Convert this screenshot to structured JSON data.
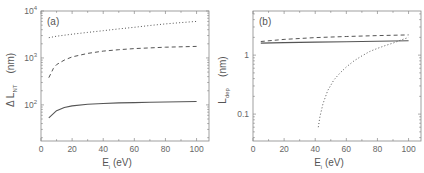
{
  "chart_data": [
    {
      "type": "line",
      "panel_label": "(a)",
      "title": "",
      "xlabel": "E",
      "xlabel_sub": "i",
      "xlabel_unit": "(eV)",
      "ylabel": "Δ L",
      "ylabel_sub": "NT",
      "ylabel_unit": "(nm)",
      "xscale": "linear",
      "yscale": "log",
      "xlim": [
        0,
        108
      ],
      "ylim": [
        17,
        10000
      ],
      "xticks": [
        0,
        20,
        40,
        60,
        80,
        100
      ],
      "yticks": [
        100,
        1000,
        10000
      ],
      "ytick_labels": [
        {
          "base": "10",
          "exp": "2"
        },
        {
          "base": "10",
          "exp": "3"
        },
        {
          "base": "10",
          "exp": "4"
        }
      ],
      "grid": false,
      "legend": null,
      "series": [
        {
          "name": "solid",
          "style": "solid",
          "x": [
            5,
            10,
            15,
            20,
            30,
            40,
            50,
            60,
            70,
            80,
            90,
            100
          ],
          "values": [
            53,
            75,
            88,
            95,
            103,
            107,
            110,
            112,
            114,
            115,
            117,
            118
          ]
        },
        {
          "name": "dashed",
          "style": "dashed",
          "x": [
            5,
            8,
            10,
            15,
            20,
            30,
            40,
            50,
            60,
            70,
            80,
            90,
            100
          ],
          "values": [
            380,
            600,
            720,
            900,
            1050,
            1250,
            1400,
            1500,
            1580,
            1640,
            1690,
            1730,
            1760
          ]
        },
        {
          "name": "dotted",
          "style": "dotted",
          "x": [
            5,
            10,
            20,
            30,
            40,
            50,
            60,
            70,
            80,
            90,
            100
          ],
          "values": [
            2700,
            2900,
            3200,
            3500,
            3800,
            4150,
            4500,
            4900,
            5300,
            5650,
            6000
          ]
        }
      ]
    },
    {
      "type": "line",
      "panel_label": "(b)",
      "title": "",
      "xlabel": "E",
      "xlabel_sub": "i",
      "xlabel_unit": "(eV)",
      "ylabel": "L",
      "ylabel_sub": "dep",
      "ylabel_unit": "(nm)",
      "xscale": "linear",
      "yscale": "log",
      "xlim": [
        0,
        108
      ],
      "ylim": [
        0.035,
        5.6
      ],
      "xticks": [
        0,
        20,
        40,
        60,
        80,
        100
      ],
      "yticks": [
        0.1,
        1
      ],
      "ytick_labels": [
        "0.1",
        "1"
      ],
      "grid": false,
      "legend": null,
      "series": [
        {
          "name": "solid",
          "style": "solid",
          "x": [
            5,
            20,
            40,
            60,
            80,
            100
          ],
          "values": [
            1.6,
            1.63,
            1.66,
            1.69,
            1.72,
            1.75
          ]
        },
        {
          "name": "dashed",
          "style": "dashed",
          "x": [
            5,
            20,
            40,
            60,
            80,
            100
          ],
          "values": [
            1.7,
            1.85,
            1.98,
            2.07,
            2.14,
            2.2
          ]
        },
        {
          "name": "dotted",
          "style": "dotted",
          "x": [
            42,
            43,
            45,
            48,
            52,
            56,
            60,
            65,
            70,
            75,
            80,
            85,
            90,
            95,
            100
          ],
          "values": [
            0.06,
            0.09,
            0.15,
            0.25,
            0.38,
            0.5,
            0.63,
            0.8,
            0.97,
            1.15,
            1.3,
            1.45,
            1.6,
            1.8,
            2.0
          ]
        }
      ]
    }
  ]
}
